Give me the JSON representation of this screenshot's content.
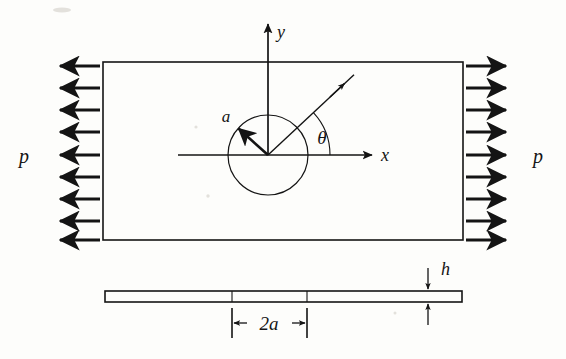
{
  "figure": {
    "background_color": "#fdfdfb",
    "ink_color": "#141414"
  },
  "labels": {
    "load_left": "p",
    "load_right": "p",
    "axis_x": "x",
    "axis_y": "y",
    "radius": "a",
    "angle": "θ",
    "thickness": "h",
    "hole_width": "2a"
  },
  "plan_view": {
    "name": "plate-plan-view",
    "rect": {
      "x": 103,
      "y": 62,
      "width": 360,
      "height": 178
    },
    "hole": {
      "cx": 268,
      "cy": 155,
      "r": 40
    },
    "axes": {
      "x_axis": {
        "x1": 178,
        "y1": 155,
        "x2": 377,
        "y2": 155
      },
      "y_axis": {
        "x1": 268,
        "y1": 155,
        "x2": 268,
        "y2": 19
      }
    },
    "radius_arrow": {
      "angle_deg": 137,
      "length": 40
    },
    "theta_ray": {
      "angle_deg": 43,
      "length": 118
    },
    "theta_arc_radius": 62
  },
  "load_arrows": {
    "count_per_side": 9,
    "first_y": 66,
    "spacing": 22,
    "left_direction": "left",
    "right_direction": "right",
    "left_tail_x": 100,
    "left_head_x": 55,
    "right_tail_x": 466,
    "right_head_x": 511
  },
  "side_view": {
    "name": "plate-side-view",
    "bar": {
      "x": 105,
      "y": 291,
      "width": 357,
      "height": 11
    },
    "hole_edges_x": [
      232,
      307
    ],
    "thickness_dim_x": 428,
    "hole_dim": {
      "y": 323,
      "x1": 232,
      "x2": 307
    }
  }
}
